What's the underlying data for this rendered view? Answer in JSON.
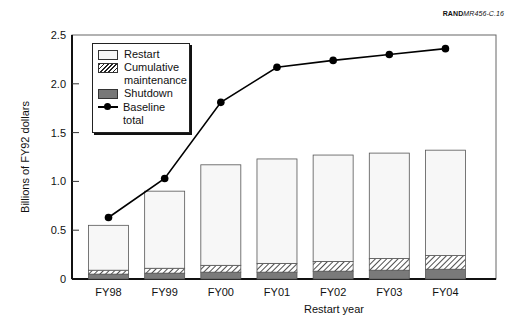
{
  "source_label": {
    "bold": "RAND",
    "italic": "MR456-C.16"
  },
  "chart_data": {
    "type": "bar",
    "stacked": true,
    "title": "",
    "xlabel": "Restart year",
    "ylabel": "Billions of FY92 dollars",
    "ylim": [
      0,
      2.5
    ],
    "yticks": [
      0,
      0.5,
      1.0,
      1.5,
      2.0,
      2.5
    ],
    "ytick_labels": [
      "0",
      "0.5",
      "1.0",
      "1.5",
      "2.0",
      "2.5"
    ],
    "grid": false,
    "legend_position": "upper left",
    "categories": [
      "FY98",
      "FY99",
      "FY00",
      "FY01",
      "FY02",
      "FY03",
      "FY04"
    ],
    "series": [
      {
        "name": "Shutdown",
        "kind": "bar",
        "pattern": "solid gray",
        "values": [
          0.05,
          0.06,
          0.07,
          0.07,
          0.08,
          0.09,
          0.1
        ]
      },
      {
        "name": "Cumulative maintenance",
        "kind": "bar",
        "pattern": "hatched",
        "values": [
          0.04,
          0.05,
          0.07,
          0.09,
          0.1,
          0.12,
          0.14
        ]
      },
      {
        "name": "Restart",
        "kind": "bar",
        "pattern": "white",
        "values": [
          0.46,
          0.79,
          1.03,
          1.07,
          1.09,
          1.08,
          1.08
        ]
      },
      {
        "name": "Baseline total",
        "kind": "line",
        "marker": "circle",
        "values": [
          0.63,
          1.03,
          1.81,
          2.17,
          2.24,
          2.3,
          2.36
        ]
      }
    ],
    "bar_totals": [
      0.55,
      0.9,
      1.17,
      1.23,
      1.27,
      1.29,
      1.32
    ]
  },
  "legend": {
    "items": [
      {
        "label_lines": [
          "Restart"
        ],
        "type": "restart"
      },
      {
        "label_lines": [
          "Cumulative",
          "maintenance"
        ],
        "type": "maint"
      },
      {
        "label_lines": [
          "Shutdown"
        ],
        "type": "shut"
      },
      {
        "label_lines": [
          "Baseline",
          "total"
        ],
        "type": "line"
      }
    ]
  }
}
